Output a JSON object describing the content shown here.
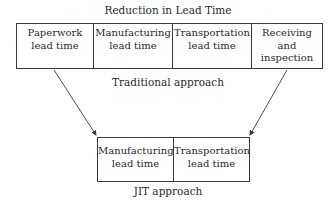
{
  "diagram": {
    "title": "Reduction in Lead Time",
    "traditional": {
      "label": "Traditional approach",
      "cells": [
        "Paperwork\nlead time",
        "Manufacturing\nlead time",
        "Transportation\nlead time",
        "Receiving\nand\ninspection"
      ]
    },
    "jit": {
      "label": "JIT approach",
      "cells": [
        "Manufacturing\nlead time",
        "Transportation\nlead time"
      ]
    },
    "arrows": [
      {
        "from": "Paperwork lead time",
        "to": "JIT approach box (left)"
      },
      {
        "from": "Receiving and inspection",
        "to": "JIT approach box (right)"
      }
    ]
  }
}
